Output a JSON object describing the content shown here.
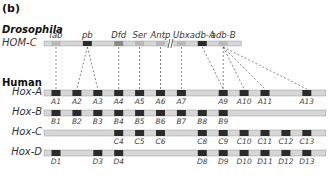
{
  "panel_label": "(b)",
  "species": {
    "drosophila": "Drosophila",
    "human": "Human"
  },
  "colors": {
    "bar_fill": "#d6d6d6",
    "bar_edge": "#9a9a9a",
    "dark_gene": "#2b2b2b",
    "mid_gene": "#8a8a8a",
    "light_gene": "#b8b8b8",
    "connector": "#555555"
  },
  "hom_c": {
    "label": "HOM-C",
    "genes": [
      {
        "name": "lab",
        "shade": "light",
        "slot": 1
      },
      {
        "name": "pb",
        "shade": "dark",
        "slot": 2.5
      },
      {
        "name": "Dfd",
        "shade": "mid",
        "slot": 4
      },
      {
        "name": "Ser",
        "shade": "light",
        "slot": 5
      },
      {
        "name": "Antp",
        "shade": "light",
        "slot": 6
      },
      {
        "name": "Ubx",
        "shade": "light",
        "slot": 7
      },
      {
        "name": "adb-A",
        "shade": "dark",
        "slot": 8
      },
      {
        "name": "adb-B",
        "shade": "light",
        "slot": 9
      }
    ],
    "break_after": "Antp"
  },
  "hox_clusters": [
    {
      "label": "Hox-A",
      "prefix": "A",
      "genes": [
        1,
        2,
        3,
        4,
        5,
        6,
        7,
        9,
        10,
        11,
        13
      ]
    },
    {
      "label": "Hox-B",
      "prefix": "B",
      "genes": [
        1,
        2,
        3,
        4,
        5,
        6,
        7,
        8,
        9
      ]
    },
    {
      "label": "Hox-C",
      "prefix": "C",
      "genes": [
        4,
        5,
        6,
        8,
        9,
        10,
        11,
        12,
        13
      ]
    },
    {
      "label": "Hox-D",
      "prefix": "D",
      "genes": [
        1,
        3,
        4,
        8,
        9,
        10,
        11,
        12,
        13
      ]
    }
  ],
  "connections": [
    {
      "from": "lab",
      "to": [
        "A1"
      ]
    },
    {
      "from": "pb",
      "to": [
        "A2",
        "A3"
      ]
    },
    {
      "from": "Dfd",
      "to": [
        "A4"
      ]
    },
    {
      "from": "Ser",
      "to": [
        "A5"
      ]
    },
    {
      "from": "Antp",
      "to": [
        "A6"
      ]
    },
    {
      "from": "Ubx",
      "to": [
        "A7"
      ]
    },
    {
      "from": "adb-A",
      "to": [
        "A9"
      ]
    },
    {
      "from": "adb-B",
      "to": [
        "A9",
        "A10",
        "A11",
        "A13"
      ]
    }
  ]
}
